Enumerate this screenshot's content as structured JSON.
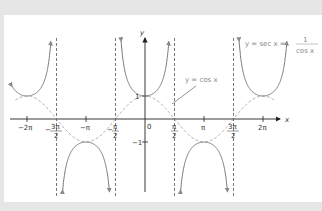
{
  "figure": {
    "axis_x_label": "x",
    "axis_y_label": "y",
    "origin_label": "0",
    "y_tick_labels": {
      "pos": "1",
      "neg": "−1"
    },
    "x_tick_labels": [
      {
        "num": "−2π",
        "den": ""
      },
      {
        "num": "3π",
        "den": "2",
        "sign": "−"
      },
      {
        "num": "−π",
        "den": ""
      },
      {
        "num": "π",
        "den": "2",
        "sign": "−"
      },
      {
        "num": "π",
        "den": "2",
        "sign": ""
      },
      {
        "num": "π",
        "den": ""
      },
      {
        "num": "3π",
        "den": "2",
        "sign": ""
      },
      {
        "num": "2π",
        "den": ""
      }
    ],
    "label_cos": "y = cos x",
    "label_sec_lhs": "y = sec x =",
    "label_sec_num": "1",
    "label_sec_den": "cos x"
  },
  "colors": {
    "background": "#e6e6e6",
    "panel": "#ffffff",
    "curve": "#777777",
    "asymptote": "#555555",
    "axis": "#222222"
  },
  "chart_data": {
    "type": "line",
    "title": "",
    "xlabel": "x",
    "ylabel": "y",
    "xlim": [
      -6.6,
      6.6
    ],
    "series": [
      {
        "name": "y = sec x",
        "style": "solid",
        "function": "1/cos(x)"
      },
      {
        "name": "y = cos x",
        "style": "dashed",
        "function": "cos(x)"
      }
    ],
    "asymptotes": [
      "-3π/2",
      "-π/2",
      "π/2",
      "3π/2"
    ],
    "x_ticks": [
      "-2π",
      "-3π/2",
      "-π",
      "-π/2",
      "π/2",
      "π",
      "3π/2",
      "2π"
    ],
    "y_ticks": [
      1,
      -1
    ]
  }
}
